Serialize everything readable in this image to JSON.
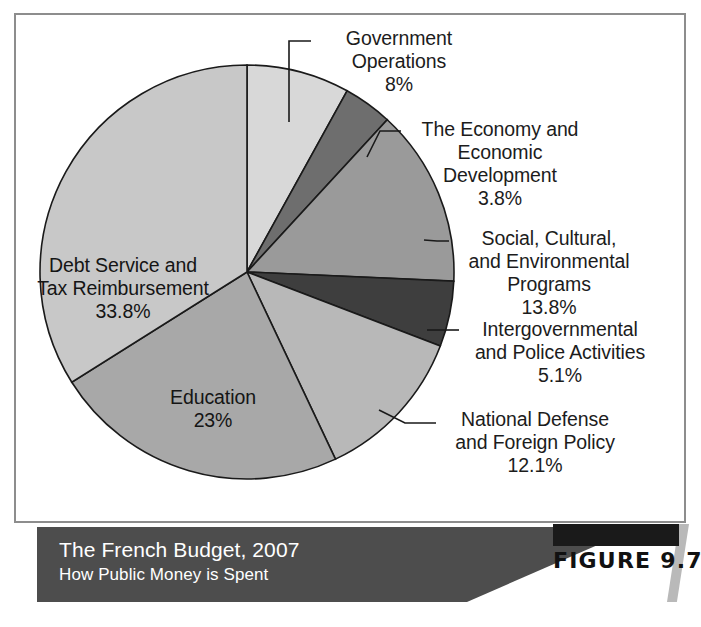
{
  "figure": {
    "number_label": "FIGURE 9.7",
    "caption_title": "The French Budget, 2007",
    "caption_subtitle": "How Public Money is Spent"
  },
  "chart_data": {
    "type": "pie",
    "title": "The French Budget, 2007",
    "subtitle": "How Public Money is Spent",
    "xlabel": "",
    "ylabel": "",
    "grid": false,
    "legend": "none (direct slice labels with leader lines)",
    "start_angle_deg": 0,
    "direction": "clockwise",
    "units": "percent",
    "total": 99.6,
    "categories": [
      "Government Operations",
      "The Economy and Economic Development",
      "Social, Cultural, and Environmental Programs",
      "Intergovernmental and Police Activities",
      "National Defense and Foreign Policy",
      "Education",
      "Debt Service and Tax Reimbursement"
    ],
    "values": [
      8,
      3.8,
      13.8,
      5.1,
      12.1,
      23,
      33.8
    ],
    "value_labels": [
      "8%",
      "3.8%",
      "13.8%",
      "5.1%",
      "12.1%",
      "23%",
      "33.8%"
    ],
    "colors": [
      "#d8d8d8",
      "#6e6e6e",
      "#9a9a9a",
      "#3e3e3e",
      "#b8b8b8",
      "#a8a8a8",
      "#c8c8c8"
    ],
    "slices": [
      {
        "name": "Government Operations",
        "value": 8,
        "value_label": "8%",
        "color": "#d8d8d8",
        "label_text": "Government\nOperations\n8%",
        "label_placement": "outside-top-right"
      },
      {
        "name": "The Economy and Economic Development",
        "value": 3.8,
        "value_label": "3.8%",
        "color": "#6e6e6e",
        "label_text": "The Economy and\nEconomic\nDevelopment\n3.8%",
        "label_placement": "outside-right"
      },
      {
        "name": "Social, Cultural, and Environmental Programs",
        "value": 13.8,
        "value_label": "13.8%",
        "color": "#9a9a9a",
        "label_text": "Social, Cultural,\nand Environmental\nPrograms\n13.8%",
        "label_placement": "outside-right"
      },
      {
        "name": "Intergovernmental and Police Activities",
        "value": 5.1,
        "value_label": "5.1%",
        "color": "#3e3e3e",
        "label_text": "Intergovernmental\nand Police Activities\n5.1%",
        "label_placement": "outside-right"
      },
      {
        "name": "National Defense and Foreign Policy",
        "value": 12.1,
        "value_label": "12.1%",
        "color": "#b8b8b8",
        "label_text": "National Defense\nand Foreign Policy\n12.1%",
        "label_placement": "outside-bottom-right"
      },
      {
        "name": "Education",
        "value": 23,
        "value_label": "23%",
        "color": "#a8a8a8",
        "label_text": "Education\n23%",
        "label_placement": "inside"
      },
      {
        "name": "Debt Service and Tax Reimbursement",
        "value": 33.8,
        "value_label": "33.8%",
        "color": "#c8c8c8",
        "label_text": "Debt Service and\nTax Reimbursement\n33.8%",
        "label_placement": "inside"
      }
    ]
  },
  "style": {
    "slice_outline": "#1a1a1a",
    "frame_border": "#8d8d8d",
    "caption_bar_bg": "#4d4d4d",
    "caption_text": "#ffffff",
    "figure_block_bg": "#1a1a1a",
    "background": "#ffffff"
  }
}
